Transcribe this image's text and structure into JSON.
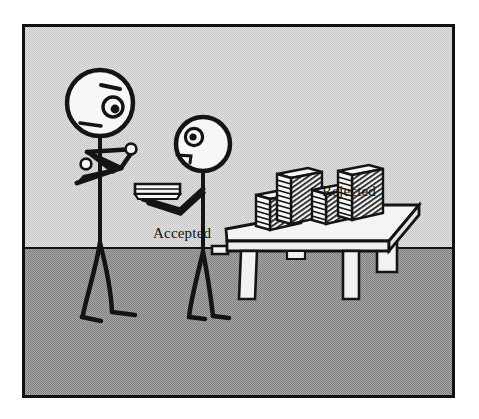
{
  "scene": {
    "title": "Accepted and Rejected papers cartoon",
    "frame": {
      "border_color": "#111111",
      "sky_color": "#d8d8d8",
      "floor_color": "#9a9a9a",
      "horizon_y": 220
    }
  },
  "labels": {
    "accepted": "Accepted",
    "rejected": "Rejected"
  },
  "figures": [
    {
      "id": "figure-left",
      "role": "reviewer-with-crossed-arms",
      "expression": "frowning",
      "arms": "crossed",
      "hands_visible": 2
    },
    {
      "id": "figure-right",
      "role": "author-holding-small-stack",
      "expression": "neutral",
      "arms": "extended-forward",
      "holding": "thin-paper-stack"
    }
  ],
  "table": {
    "id": "rejection-table",
    "legs": 3,
    "stacks": [
      {
        "id": "stack-1",
        "sheets": 7,
        "height_label": "short"
      },
      {
        "id": "stack-2",
        "sheets": 11,
        "height_label": "tall"
      },
      {
        "id": "stack-3",
        "sheets": 8,
        "height_label": "medium"
      },
      {
        "id": "stack-4",
        "sheets": 12,
        "height_label": "tallest"
      }
    ]
  },
  "colors": {
    "ink": "#111111",
    "paper_white": "#f6f6f6",
    "paper_shade": "#cfcfcf",
    "sky": "#d8d8d8",
    "floor": "#9a9a9a"
  }
}
